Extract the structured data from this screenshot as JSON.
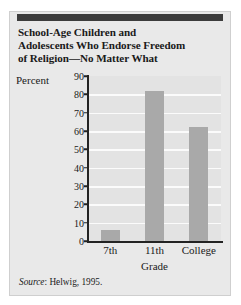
{
  "figure": {
    "title": "School-Age Children and Adolescents Who Endorse Freedom of Religion—No Matter What",
    "title_lines": [
      "School-Age Children and",
      "Adolescents Who Endorse Freedom",
      "of Religion—No Matter What"
    ],
    "source_prefix": "Source",
    "source_separator": ": ",
    "source_text": "Helwig, 1995.",
    "panel_background": "#e9e9e9",
    "rule_color": "#3c3c3c"
  },
  "chart_data": {
    "type": "bar",
    "title": "School-Age Children and Adolescents Who Endorse Freedom of Religion—No Matter What",
    "categories": [
      "7th",
      "11th",
      "College"
    ],
    "values": [
      6,
      82,
      62
    ],
    "series": [
      {
        "name": "Percent endorsing freedom of religion",
        "values": [
          6,
          82,
          62
        ]
      }
    ],
    "xlabel": "Grade",
    "ylabel": "Percent",
    "ylim": [
      0,
      90
    ],
    "ytick_step": 10,
    "yticks": [
      90,
      80,
      70,
      60,
      50,
      40,
      30,
      20,
      10,
      0
    ],
    "ytick_labels": [
      "90",
      "80",
      "70",
      "60",
      "50",
      "40",
      "30",
      "20",
      "10",
      "0"
    ],
    "grid": true,
    "grid_color": "#fbfbfb",
    "legend": null,
    "bar_color": "#a9a9a9",
    "plot_background": "#e3e3e3",
    "axis_color": "#232323"
  }
}
